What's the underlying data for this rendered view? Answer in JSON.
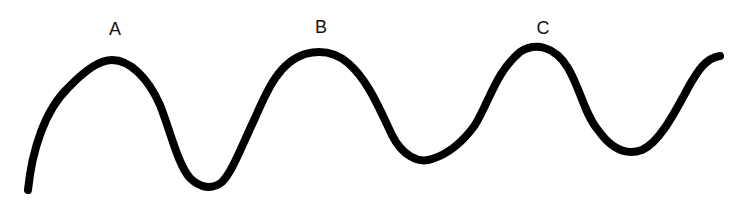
{
  "diagram": {
    "type": "wave",
    "stroke_color": "#000000",
    "background": "#ffffff",
    "peaks": [
      {
        "label": "A",
        "x": 115,
        "y": 20
      },
      {
        "label": "B",
        "x": 321,
        "y": 18
      },
      {
        "label": "C",
        "x": 543,
        "y": 19
      }
    ]
  }
}
